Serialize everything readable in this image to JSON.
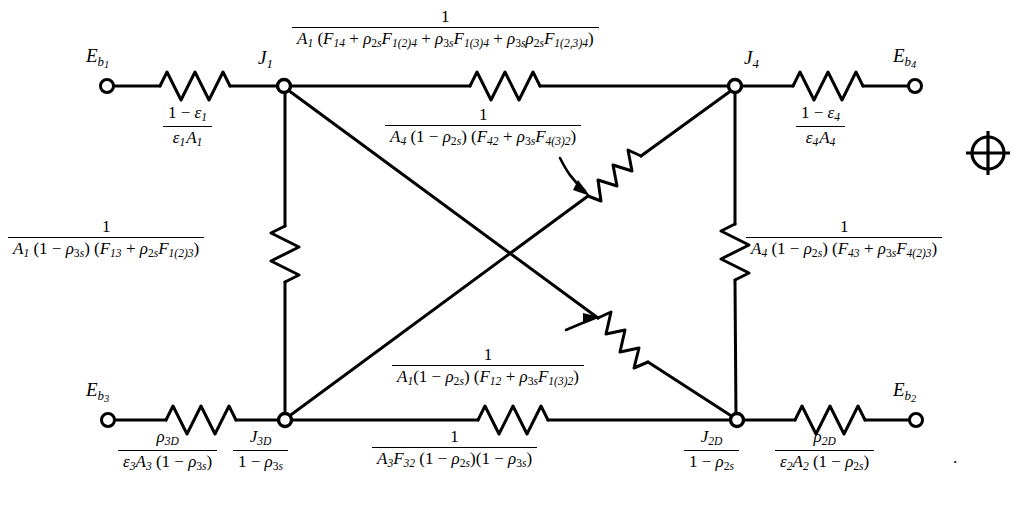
{
  "figure": {
    "kind": "radiation-network-diagram",
    "background_color": "#ffffff",
    "line_color": "#000000",
    "width": 1029,
    "height": 510
  },
  "terminals": [
    {
      "id": "Eb1",
      "label_html": "E<sub>b</sub><sub>1</sub>",
      "plain": "Eb1",
      "x": 107,
      "y": 86,
      "label_x": 86,
      "label_y": 50
    },
    {
      "id": "Eb4",
      "label_html": "E<sub>b</sub><sub>4</sub>",
      "plain": "Eb4",
      "x": 915,
      "y": 86,
      "label_x": 893,
      "label_y": 50
    },
    {
      "id": "Eb3",
      "label_html": "E<sub>b</sub><sub>3</sub>",
      "plain": "Eb3",
      "x": 108,
      "y": 420,
      "label_x": 86,
      "label_y": 384
    },
    {
      "id": "Eb2",
      "label_html": "E<sub>b</sub><sub>2</sub>",
      "plain": "Eb2",
      "x": 916,
      "y": 420,
      "label_x": 893,
      "label_y": 384
    }
  ],
  "nodes": [
    {
      "id": "J1",
      "label": "J1",
      "x": 284,
      "y": 86,
      "label_x": 256,
      "label_y": 52
    },
    {
      "id": "J4",
      "label": "J4",
      "x": 735,
      "y": 86,
      "label_x": 742,
      "label_y": 52
    },
    {
      "id": "J3D",
      "label": "J3D",
      "x": 285,
      "y": 420,
      "label_x": 241,
      "label_y": 429
    },
    {
      "id": "J2D",
      "label": "J2D",
      "x": 737,
      "y": 420,
      "label_x": 672,
      "label_y": 429
    }
  ],
  "labels": {
    "J1": "J",
    "J1_sub": "1",
    "J4": "J",
    "J4_sub": "4",
    "J3D_num": "J",
    "J3D_num_sub": "3D",
    "J3D_den": "1 − ρ",
    "J3D_den_sub": "3s",
    "J2D_num": "J",
    "J2D_num_sub": "2D",
    "J2D_den": "1 − ρ",
    "J2D_den_sub": "2s"
  },
  "resistors": {
    "top_left": {
      "name": "surface-resistance-1",
      "formula_plain": "(1 - ε₁) / (ε₁ A₁)",
      "num": "1 − ϵ",
      "num_sub": "1",
      "den_a": "ϵ",
      "den_a_sub": "1",
      "den_b": "A",
      "den_b_sub": "1"
    },
    "top_right": {
      "name": "surface-resistance-4",
      "formula_plain": "(1 - ε₄) / (ε₄ A₄)",
      "num": "1 − ϵ",
      "num_sub": "4",
      "den_a": "ϵ",
      "den_a_sub": "4",
      "den_b": "A",
      "den_b_sub": "4"
    },
    "bottom_left": {
      "name": "surface-resistance-3D",
      "formula_plain": "ρ_3D / (ε₃ A₃ (1 - ρ_3s))",
      "num": "ρ",
      "num_sub": "3D",
      "den": "ϵ₃A₃ (1 − ρ₃ₛ)"
    },
    "bottom_right": {
      "name": "surface-resistance-2D",
      "formula_plain": "ρ_2D / (ε₂ A₂ (1 - ρ_2s))",
      "num": "ρ",
      "num_sub": "2D",
      "den": "ϵ₂A₂ (1 − ρ₂ₛ)",
      "trailing_period": "."
    },
    "top_center": {
      "name": "space-resistance-1-4",
      "formula_plain": "1 / (A1 (F14 + rho2s F1(2)4 + rho3s F1(3)4 + rho3s rho2s F1(2,3)4))",
      "num": "1",
      "den": "A₁ (F₁₄ + ρ₂ₛF₁(₂)₄ + ρ₃ₛF₁(₃)₄ + ρ₃ₛρ₂ₛF₁(₂,₃)₄)"
    },
    "diag_42": {
      "name": "space-resistance-4-2",
      "formula_plain": "1 / (A4 (1 - rho2s)(F42 + rho3s F4(3)2))",
      "num": "1",
      "den": "A₄ (1 − ρ₂ₛ)(F₄₂ + ρ₃ₛF₄(₃)₂)"
    },
    "diag_12": {
      "name": "space-resistance-1-2",
      "formula_plain": "1 / (A1(1 - rho2s)(F12 + rho3s F1(3)2))",
      "num": "1",
      "den": "A₁(1 − ρ₂ₛ) (F₁₂ + ρ₃ₛF₁(₃)₂)"
    },
    "left_vertical": {
      "name": "space-resistance-1-3",
      "formula_plain": "1 / (A1 (1 - rho3s)(F13 + rho2s F1(2)3))",
      "num": "1",
      "den": "A₁ (1 − ρ₃ₛ) (F₁₃ + ρ₂ₛF₁(₂)₃)"
    },
    "right_vertical": {
      "name": "space-resistance-4-3",
      "formula_plain": "1 / (A4 (1 - rho2s)(F43 + rho3s F4(2)3))",
      "num": "1",
      "den": "A₄ (1 − ρ₂ₛ) (F₄₃ + ρ₃ₛF₄(₂)₃)"
    },
    "bottom_center": {
      "name": "space-resistance-3-2",
      "formula_plain": "1 / (A3 F32 (1 - rho2s)(1 - rho3s))",
      "num": "1",
      "den": "A₃F₃₂ (1 − ρ₂ₛ)(1 − ρ₃ₛ)"
    }
  },
  "registration_mark": {
    "name": "registration-crosshair",
    "x": 988,
    "y": 153,
    "radius": 17
  }
}
